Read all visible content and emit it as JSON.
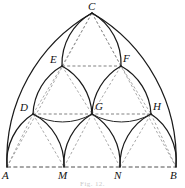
{
  "figure": {
    "caption": "Fig. 12.",
    "colors": {
      "arc_stroke": "#1a1a1a",
      "chord_stroke": "#4a4a4a",
      "baseline_stroke": "#3d3d3d",
      "background": "#ffffff",
      "label_color": "#111111"
    },
    "vertices": [
      {
        "id": "A",
        "label": "A",
        "x": 7,
        "y": 167,
        "label_x": 2,
        "label_y": 169,
        "row": "base"
      },
      {
        "id": "M",
        "label": "M",
        "x": 64,
        "y": 167,
        "label_x": 59,
        "label_y": 169,
        "row": "base"
      },
      {
        "id": "N",
        "label": "N",
        "x": 120,
        "y": 167,
        "label_x": 115,
        "label_y": 169,
        "row": "base"
      },
      {
        "id": "B",
        "label": "B",
        "x": 176,
        "y": 167,
        "label_x": 171,
        "label_y": 169,
        "row": "base"
      },
      {
        "id": "D",
        "label": "D",
        "x": 33,
        "y": 114,
        "label_x": 21,
        "label_y": 106,
        "row": "middle"
      },
      {
        "id": "G",
        "label": "G",
        "x": 92,
        "y": 114,
        "label_x": 95,
        "label_y": 104,
        "row": "middle"
      },
      {
        "id": "H",
        "label": "H",
        "x": 151,
        "y": 114,
        "label_x": 153,
        "label_y": 104,
        "row": "middle"
      },
      {
        "id": "E",
        "label": "E",
        "x": 62,
        "y": 66,
        "label_x": 51,
        "label_y": 57,
        "row": "upper"
      },
      {
        "id": "F",
        "label": "F",
        "x": 121,
        "y": 66,
        "label_x": 124,
        "label_y": 56,
        "row": "upper"
      },
      {
        "id": "C",
        "label": "C",
        "x": 92,
        "y": 13,
        "label_x": 88,
        "label_y": 2,
        "row": "apex"
      }
    ],
    "level_rows": {
      "base_y": 167,
      "middle_y": 114,
      "upper_y": 66,
      "apex_y": 13
    },
    "arcs": [
      {
        "name": "outer-left-A-to-C",
        "from": "A",
        "to": "C",
        "bow": "left"
      },
      {
        "name": "outer-right-B-to-C",
        "from": "B",
        "to": "C",
        "bow": "right"
      },
      {
        "name": "arch-A-M-apex-D",
        "from": "A",
        "to": "M",
        "apex": "D"
      },
      {
        "name": "arch-M-N-apex-G",
        "from": "M",
        "to": "N",
        "apex": "G"
      },
      {
        "name": "arch-N-B-apex-H",
        "from": "N",
        "to": "B",
        "apex": "H"
      },
      {
        "name": "arch-D-G-apex-E",
        "from": "D",
        "to": "G",
        "apex": "E"
      },
      {
        "name": "arch-G-H-apex-F",
        "from": "G",
        "to": "H",
        "apex": "F"
      },
      {
        "name": "arch-E-F-apex-C",
        "from": "E",
        "to": "F",
        "apex": "C"
      }
    ],
    "chords": [
      {
        "name": "baseline-A-B",
        "from": "A",
        "to": "B",
        "style": "dashed"
      },
      {
        "name": "chord-D-G-H",
        "from": "D",
        "to": "H",
        "style": "dashed"
      },
      {
        "name": "chord-E-F",
        "from": "E",
        "to": "F",
        "style": "dashed"
      },
      {
        "name": "chord-A-D",
        "from": "A",
        "to": "D",
        "style": "dashed"
      },
      {
        "name": "chord-D-M",
        "from": "D",
        "to": "M",
        "style": "dashed"
      },
      {
        "name": "chord-M-G",
        "from": "M",
        "to": "G",
        "style": "dashed"
      },
      {
        "name": "chord-G-N",
        "from": "G",
        "to": "N",
        "style": "dashed"
      },
      {
        "name": "chord-N-H",
        "from": "N",
        "to": "H",
        "style": "dashed"
      },
      {
        "name": "chord-H-B",
        "from": "H",
        "to": "B",
        "style": "dashed"
      },
      {
        "name": "chord-D-E",
        "from": "D",
        "to": "E",
        "style": "dashed"
      },
      {
        "name": "chord-E-G",
        "from": "E",
        "to": "G",
        "style": "dashed"
      },
      {
        "name": "chord-G-F",
        "from": "G",
        "to": "F",
        "style": "dashed"
      },
      {
        "name": "chord-F-H",
        "from": "F",
        "to": "H",
        "style": "dashed"
      },
      {
        "name": "chord-E-C",
        "from": "E",
        "to": "C",
        "style": "dashed"
      },
      {
        "name": "chord-C-F",
        "from": "C",
        "to": "F",
        "style": "dashed"
      },
      {
        "name": "chord-A-C",
        "from": "A",
        "to": "C",
        "style": "dashed"
      },
      {
        "name": "chord-C-B",
        "from": "C",
        "to": "B",
        "style": "dashed"
      }
    ]
  }
}
